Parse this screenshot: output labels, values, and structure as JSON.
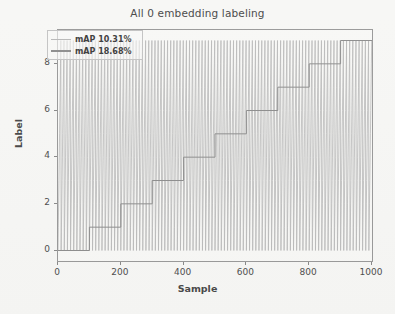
{
  "chart_data": {
    "type": "line",
    "title": "All 0 embedding labeling",
    "xlabel": "Sample",
    "ylabel": "Label",
    "xlim": [
      0,
      1000
    ],
    "ylim": [
      -0.45,
      9.45
    ],
    "xticks": [
      0,
      200,
      400,
      600,
      800,
      1000
    ],
    "xticklabels": [
      "0",
      "200",
      "400",
      "600",
      "800",
      "1000"
    ],
    "yticks": [
      0,
      2,
      4,
      6,
      8
    ],
    "yticklabels": [
      "0",
      "2",
      "4",
      "6",
      "8"
    ],
    "grid": false,
    "legend_position": "upper left",
    "series": [
      {
        "name": "mAP 10.31%",
        "color": "#b9b9b9",
        "linewidth": 0.8,
        "description": "unsorted labels cycling 0-9 across all 1000 samples, drawn as dense vertical sawtooth",
        "pattern": "sawtooth",
        "cycle": [
          0,
          1,
          2,
          3,
          4,
          5,
          6,
          7,
          8,
          9
        ],
        "period": 10,
        "n_points": 1000
      },
      {
        "name": "mAP 18.68%",
        "color": "#8f8f8f",
        "linewidth": 1.0,
        "description": "sorted labels forming monotonic staircase, one step of 100 samples per label",
        "pattern": "staircase",
        "step_width": 100,
        "x": [
          0,
          100,
          100,
          200,
          200,
          300,
          300,
          400,
          400,
          500,
          500,
          600,
          600,
          700,
          700,
          800,
          800,
          900,
          900,
          1000
        ],
        "y": [
          0,
          0,
          1,
          1,
          2,
          2,
          3,
          3,
          4,
          4,
          5,
          5,
          6,
          6,
          7,
          7,
          8,
          8,
          9,
          9
        ],
        "levels": [
          0,
          1,
          2,
          3,
          4,
          5,
          6,
          7,
          8,
          9
        ],
        "n_points": 1000
      }
    ]
  },
  "legend": {
    "entries": [
      {
        "label": "mAP 10.31%"
      },
      {
        "label": "mAP 18.68%"
      }
    ]
  },
  "colors": {
    "figure_background": "#f7f7f5",
    "axes_background": "#f8f8f6",
    "frame": "#9a9a9a",
    "text": "#4a4a4a",
    "series_1": "#b9b9b9",
    "series_2": "#8f8f8f"
  }
}
